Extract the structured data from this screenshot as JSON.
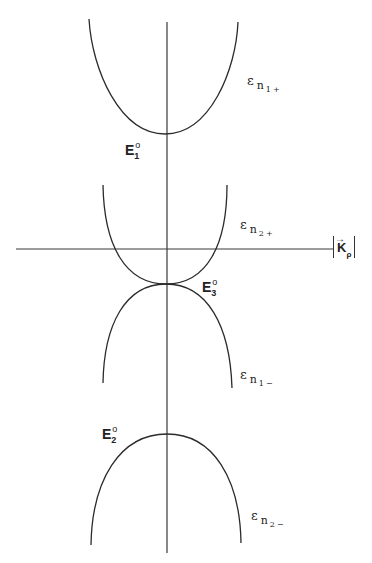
{
  "figure": {
    "type": "energy band diagram",
    "axes": {
      "horizontal_label_main": "K",
      "horizontal_label_sub": "ρ",
      "horizontal_label_arrow": "→",
      "horizontal_label_bars": "|"
    },
    "curves": [
      {
        "name": "epsilon-n1-plus",
        "label_main": "ε",
        "label_sub": "n",
        "label_index": "1",
        "label_sign": "+",
        "vertex_label": "E",
        "vertex_index": "1",
        "vertex_sup": "o",
        "opens": "up"
      },
      {
        "name": "epsilon-n2-plus",
        "label_main": "ε",
        "label_sub": "n",
        "label_index": "2",
        "label_sign": "+",
        "vertex_label": "E",
        "vertex_index": "3",
        "vertex_sup": "o",
        "opens": "up"
      },
      {
        "name": "epsilon-n1-minus",
        "label_main": "ε",
        "label_sub": "n",
        "label_index": "1",
        "label_sign": "−",
        "opens": "down"
      },
      {
        "name": "epsilon-n2-minus",
        "label_main": "ε",
        "label_sub": "n",
        "label_index": "2",
        "label_sign": "−",
        "vertex_label": "E",
        "vertex_index": "2",
        "vertex_sup": "o",
        "opens": "down"
      }
    ]
  },
  "colors": {
    "background": "#ffffff",
    "ink": "#2b2b2b"
  }
}
